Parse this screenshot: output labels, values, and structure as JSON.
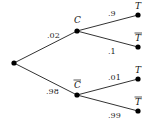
{
  "diagram": {
    "type": "probability-tree",
    "root": {
      "x": 14,
      "y": 63
    },
    "level1": [
      {
        "id": "C",
        "label": "C",
        "overline": false,
        "x": 77,
        "y": 31,
        "edge_prob": ".02",
        "prob_pos": {
          "x": 47,
          "y": 38
        },
        "label_pos": {
          "x": 74,
          "y": 23
        }
      },
      {
        "id": "Cbar",
        "label": "C",
        "overline": true,
        "x": 77,
        "y": 95,
        "edge_prob": ".98",
        "prob_pos": {
          "x": 46,
          "y": 94
        },
        "label_pos": {
          "x": 74,
          "y": 88
        }
      }
    ],
    "level2": [
      {
        "parent": "C",
        "label": "T",
        "overline": false,
        "x": 138,
        "y": 15,
        "edge_prob": ".9",
        "prob_pos": {
          "x": 108,
          "y": 16
        },
        "label_pos": {
          "x": 135,
          "y": 9
        }
      },
      {
        "parent": "C",
        "label": "T",
        "overline": true,
        "x": 138,
        "y": 47,
        "edge_prob": ".1",
        "prob_pos": {
          "x": 108,
          "y": 54
        },
        "label_pos": {
          "x": 135,
          "y": 41
        }
      },
      {
        "parent": "Cbar",
        "label": "T",
        "overline": false,
        "x": 138,
        "y": 79,
        "edge_prob": ".01",
        "prob_pos": {
          "x": 108,
          "y": 80
        },
        "label_pos": {
          "x": 135,
          "y": 73
        }
      },
      {
        "parent": "Cbar",
        "label": "T",
        "overline": true,
        "x": 138,
        "y": 111,
        "edge_prob": ".99",
        "prob_pos": {
          "x": 108,
          "y": 118
        },
        "label_pos": {
          "x": 135,
          "y": 105
        }
      }
    ]
  }
}
